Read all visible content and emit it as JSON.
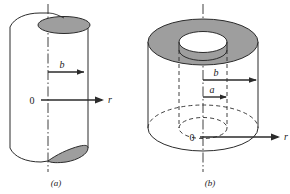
{
  "figure": {
    "panels": [
      {
        "id": "a",
        "caption": "(a)",
        "description": "solid cylinder of radius b with cutaway end faces",
        "labels": {
          "radius_b": "b",
          "origin": "0",
          "axis_r": "r"
        },
        "geometry": {
          "outer_radius_label": "b",
          "axis_type": "center-line",
          "shading": "gray end-cap ellipses"
        }
      },
      {
        "id": "b",
        "caption": "(b)",
        "description": "hollow annular cylinder, inner radius a, outer radius b",
        "labels": {
          "radius_b": "b",
          "radius_a": "a",
          "origin": "0",
          "axis_r": "r"
        },
        "geometry": {
          "outer_radius_label": "b",
          "inner_radius_label": "a",
          "axis_type": "center-line",
          "shading": "gray annulus top face",
          "hidden_lines": "dashed"
        }
      }
    ],
    "colors": {
      "stroke": "#2b2b2b",
      "shade_fill": "#9e9e9e",
      "shade_fill_light": "#b4b4b4",
      "background": "#ffffff",
      "text": "#1a1a1a"
    }
  }
}
